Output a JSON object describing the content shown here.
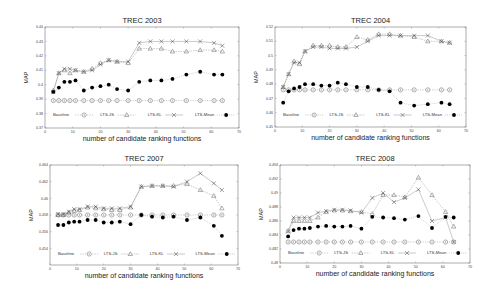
{
  "figure": {
    "xlabel": "number of candidate ranking functions",
    "ylabel": "MAP",
    "legend": [
      "Baseline",
      "LTS-JS",
      "LTS-KL",
      "LTS-Mean"
    ]
  },
  "chart_data": [
    {
      "type": "line",
      "title": "TREC 2003",
      "xlabel": "number of candidate ranking functions",
      "ylabel": "MAP",
      "xlim": [
        0,
        70
      ],
      "ylim": [
        0.37,
        0.44
      ],
      "xticks": [
        0,
        10,
        20,
        30,
        40,
        50,
        60,
        70
      ],
      "yticks": [
        0.37,
        0.38,
        0.39,
        0.4,
        0.41,
        0.42,
        0.43,
        0.44
      ],
      "ytick_labels": [
        "0.37",
        "0.38",
        "0.39",
        "0.4",
        "0.41",
        "0.42",
        "0.43",
        "0.44"
      ],
      "grid": false,
      "legend_position": "lower inside, single row",
      "layout": {
        "x0": 45,
        "x1": 239,
        "y0": 27,
        "y1": 128,
        "legend_y": 115
      },
      "x": [
        3,
        5,
        7,
        9,
        11,
        14,
        17,
        20,
        23,
        26,
        30,
        34,
        38,
        42,
        46,
        51,
        56,
        61,
        64
      ],
      "series": [
        {
          "name": "Baseline",
          "marker": "circle-open",
          "values": [
            0.389,
            0.389,
            0.389,
            0.389,
            0.389,
            0.389,
            0.389,
            0.389,
            0.389,
            0.389,
            0.389,
            0.389,
            0.389,
            0.389,
            0.389,
            0.389,
            0.389,
            0.389,
            0.389
          ]
        },
        {
          "name": "LTS-JS",
          "marker": "triangle-open",
          "values": [
            0.396,
            0.408,
            0.41,
            0.408,
            0.41,
            0.409,
            0.411,
            0.415,
            0.417,
            0.416,
            0.415,
            0.425,
            0.425,
            0.425,
            0.423,
            0.423,
            0.424,
            0.424,
            0.423
          ]
        },
        {
          "name": "LTS-KL",
          "marker": "x",
          "values": [
            0.395,
            0.408,
            0.411,
            0.411,
            0.41,
            0.409,
            0.41,
            0.414,
            0.417,
            0.416,
            0.416,
            0.429,
            0.43,
            0.43,
            0.43,
            0.43,
            0.43,
            0.429,
            0.427
          ]
        },
        {
          "name": "LTS-Mean",
          "marker": "filled-circle",
          "values": [
            0.395,
            0.398,
            0.402,
            0.402,
            0.403,
            0.396,
            0.398,
            0.399,
            0.4,
            0.397,
            0.396,
            0.402,
            0.403,
            0.403,
            0.404,
            0.407,
            0.409,
            0.407,
            0.407
          ]
        }
      ]
    },
    {
      "type": "line",
      "title": "TREC 2004",
      "xlabel": "number of candidate ranking functions",
      "ylabel": "MAP",
      "xlim": [
        0,
        70
      ],
      "ylim": [
        0.45,
        0.52
      ],
      "xticks": [
        0,
        10,
        20,
        30,
        40,
        50,
        60,
        70
      ],
      "yticks": [
        0.45,
        0.46,
        0.47,
        0.48,
        0.49,
        0.5,
        0.51,
        0.52
      ],
      "ytick_labels": [
        "0.45",
        "0.46",
        "0.47",
        "0.48",
        "0.49",
        "0.5",
        "0.51",
        "0.52"
      ],
      "grid": false,
      "legend_position": "lower inside, single row",
      "layout": {
        "x0": 275,
        "x1": 466,
        "y0": 27,
        "y1": 127,
        "legend_y": 115
      },
      "x": [
        3,
        5,
        7,
        9,
        11,
        14,
        17,
        20,
        23,
        26,
        30,
        34,
        38,
        42,
        46,
        51,
        56,
        61,
        64
      ],
      "series": [
        {
          "name": "Baseline",
          "marker": "circle-open",
          "values": [
            0.476,
            0.476,
            0.476,
            0.476,
            0.476,
            0.476,
            0.476,
            0.476,
            0.476,
            0.476,
            0.476,
            0.476,
            0.476,
            0.476,
            0.476,
            0.476,
            0.476,
            0.476,
            0.476
          ]
        },
        {
          "name": "LTS-JS",
          "marker": "triangle-open",
          "values": [
            0.478,
            0.487,
            0.496,
            0.494,
            0.503,
            0.507,
            0.507,
            0.507,
            0.506,
            0.506,
            0.513,
            0.511,
            0.515,
            0.515,
            0.514,
            0.513,
            0.51,
            0.51,
            0.509
          ]
        },
        {
          "name": "LTS-KL",
          "marker": "x",
          "values": [
            0.478,
            0.487,
            0.495,
            0.495,
            0.503,
            0.506,
            0.506,
            0.505,
            0.505,
            0.505,
            0.506,
            0.51,
            0.514,
            0.514,
            0.514,
            0.514,
            0.514,
            0.51,
            0.509
          ]
        },
        {
          "name": "LTS-Mean",
          "marker": "filled-circle",
          "values": [
            0.467,
            0.475,
            0.477,
            0.478,
            0.48,
            0.48,
            0.479,
            0.479,
            0.481,
            0.48,
            0.478,
            0.478,
            0.476,
            0.475,
            0.467,
            0.465,
            0.466,
            0.467,
            0.466
          ]
        }
      ]
    },
    {
      "type": "line",
      "title": "TREC 2007",
      "xlabel": "number of candidate ranking functions",
      "ylabel": "MAP",
      "xlim": [
        0,
        70
      ],
      "ylim": [
        0.452,
        0.464
      ],
      "xticks": [
        0,
        10,
        20,
        30,
        40,
        50,
        60,
        70
      ],
      "yticks": [
        0.454,
        0.456,
        0.458,
        0.46,
        0.462,
        0.464
      ],
      "ytick_labels": [
        "0.454",
        "0.456",
        "0.458",
        "0.46",
        "0.462",
        "0.464"
      ],
      "grid": false,
      "legend_position": "lower inside, single row",
      "layout": {
        "x0": 50,
        "x1": 238,
        "y0": 165,
        "y1": 265,
        "legend_y": 254
      },
      "x": [
        3,
        5,
        7,
        9,
        11,
        14,
        17,
        20,
        23,
        26,
        30,
        34,
        38,
        42,
        46,
        51,
        56,
        61,
        64
      ],
      "series": [
        {
          "name": "Baseline",
          "marker": "circle-open",
          "values": [
            0.458,
            0.458,
            0.458,
            0.458,
            0.458,
            0.458,
            0.458,
            0.458,
            0.458,
            0.458,
            0.458,
            0.458,
            0.458,
            0.458,
            0.458,
            0.458,
            0.458,
            0.458,
            0.458
          ]
        },
        {
          "name": "LTS-JS",
          "marker": "triangle-open",
          "values": [
            0.458,
            0.458,
            0.4583,
            0.4585,
            0.4586,
            0.4589,
            0.4588,
            0.4587,
            0.4586,
            0.4586,
            0.4589,
            0.4614,
            0.4615,
            0.4615,
            0.4615,
            0.4617,
            0.461,
            0.4603,
            0.4588
          ]
        },
        {
          "name": "LTS-KL",
          "marker": "x",
          "values": [
            0.4581,
            0.4581,
            0.4584,
            0.4587,
            0.4587,
            0.459,
            0.459,
            0.4588,
            0.4588,
            0.4588,
            0.459,
            0.4614,
            0.4615,
            0.4615,
            0.4614,
            0.462,
            0.463,
            0.4618,
            0.461
          ]
        },
        {
          "name": "LTS-Mean",
          "marker": "filled-circle",
          "values": [
            0.4568,
            0.4568,
            0.4571,
            0.4572,
            0.4572,
            0.4574,
            0.4574,
            0.4571,
            0.4571,
            0.4572,
            0.4569,
            0.458,
            0.4578,
            0.4577,
            0.4578,
            0.4574,
            0.4577,
            0.4567,
            0.4555
          ]
        }
      ]
    },
    {
      "type": "line",
      "title": "TREC 2008",
      "xlabel": "number of candidate ranking functions",
      "ylabel": "MAP",
      "xlim": [
        0,
        70
      ],
      "ylim": [
        0.48,
        0.494
      ],
      "xticks": [
        0,
        10,
        20,
        30,
        40,
        50,
        60,
        70
      ],
      "yticks": [
        0.48,
        0.482,
        0.484,
        0.486,
        0.488,
        0.49,
        0.492,
        0.494
      ],
      "ytick_labels": [
        "0.48",
        "0.482",
        "0.484",
        "0.486",
        "0.488",
        "0.49",
        "0.492",
        "0.494"
      ],
      "grid": false,
      "legend_position": "lower inside, single row",
      "layout": {
        "x0": 280,
        "x1": 470,
        "y0": 165,
        "y1": 263,
        "legend_y": 253
      },
      "x": [
        3,
        5,
        7,
        9,
        11,
        14,
        17,
        20,
        23,
        26,
        30,
        34,
        38,
        42,
        46,
        51,
        56,
        61,
        64
      ],
      "series": [
        {
          "name": "Baseline",
          "marker": "circle-open",
          "values": [
            0.483,
            0.483,
            0.483,
            0.483,
            0.483,
            0.483,
            0.483,
            0.483,
            0.483,
            0.483,
            0.483,
            0.483,
            0.483,
            0.483,
            0.483,
            0.483,
            0.483,
            0.483,
            0.483
          ]
        },
        {
          "name": "LTS-JS",
          "marker": "triangle-open",
          "values": [
            0.4846,
            0.486,
            0.486,
            0.486,
            0.486,
            0.4865,
            0.4873,
            0.4875,
            0.4875,
            0.4874,
            0.4873,
            0.487,
            0.4897,
            0.4897,
            0.4894,
            0.4922,
            0.4897,
            0.4873,
            0.4852
          ]
        },
        {
          "name": "LTS-KL",
          "marker": "x",
          "values": [
            0.4845,
            0.4865,
            0.4865,
            0.4865,
            0.4865,
            0.4872,
            0.4874,
            0.4876,
            0.4876,
            0.4875,
            0.4872,
            0.4893,
            0.49,
            0.4887,
            0.4893,
            0.4905,
            0.486,
            0.4865,
            0.483
          ]
        },
        {
          "name": "LTS-Mean",
          "marker": "filled-circle",
          "values": [
            0.4838,
            0.4847,
            0.4849,
            0.4849,
            0.485,
            0.4852,
            0.4853,
            0.4852,
            0.4852,
            0.4853,
            0.4849,
            0.4866,
            0.4865,
            0.4864,
            0.4862,
            0.4867,
            0.485,
            0.4866,
            0.4865
          ]
        }
      ]
    }
  ]
}
